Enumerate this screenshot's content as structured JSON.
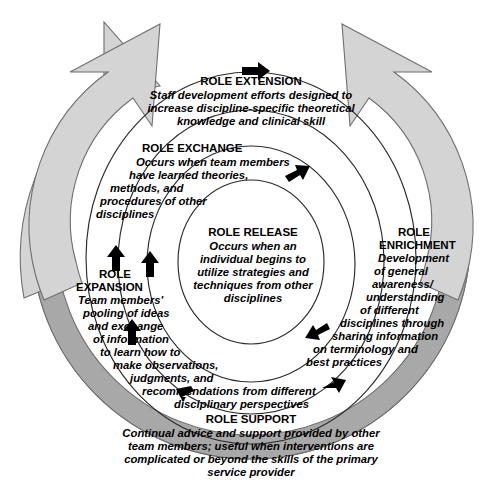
{
  "diagram": {
    "type": "concentric-spiral-process",
    "colors": {
      "flow_arrow_fill": "#d4d4d4",
      "outer_band_fill": "#a8a8a8",
      "stroke": "#6f6f6f",
      "ring_stroke": "#2b2b2b",
      "marker": "#000000",
      "background": "#ffffff",
      "text": "#000000"
    },
    "levels": [
      {
        "id": "role-extension",
        "heading": "ROLE EXTENSION",
        "lines": [
          "Staff development efforts designed to",
          "increase discipline-specific theoretical",
          "knowledge and clinical skill"
        ]
      },
      {
        "id": "role-enrichment",
        "heading_line_1": "ROLE",
        "heading_line_2": "ENRICHMENT",
        "lines": [
          "Development",
          "of general",
          "awareness/",
          "understanding",
          "of different",
          "disciplines through",
          "sharing information",
          "on terminology and",
          "best practices"
        ]
      },
      {
        "id": "role-expansion",
        "heading_line_1": "ROLE",
        "heading_line_2": "EXPANSION",
        "lines": [
          "Team members'",
          "pooling of ideas",
          "and exchange",
          "of information",
          "to learn how to",
          "make observations,",
          "judgments, and",
          "recommendations from different",
          "disciplinary perspectives"
        ]
      },
      {
        "id": "role-exchange",
        "heading": "ROLE EXCHANGE",
        "lines": [
          "Occurs when team members",
          "have learned theories,",
          "methods, and",
          "procedures of other",
          "disciplines"
        ]
      },
      {
        "id": "role-release",
        "heading": "ROLE RELEASE",
        "lines": [
          "Occurs when an",
          "individual begins to",
          "utilize strategies and",
          "techniques from other",
          "disciplines"
        ]
      },
      {
        "id": "role-support",
        "heading": "ROLE SUPPORT",
        "lines": [
          "Continual advice and support provided by other",
          "team members; useful when interventions are",
          "complicated or beyond the skills of the primary",
          "service provider"
        ]
      }
    ]
  }
}
